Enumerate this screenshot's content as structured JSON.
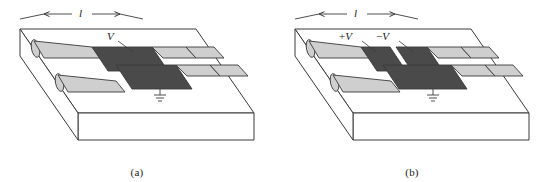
{
  "figure": {
    "type": "technical-line-diagram",
    "colors": {
      "outline": "#3a3a3a",
      "slab_face": "#ffffff",
      "strip_light": "#cfcfcf",
      "electrode_dark": "#4a4a4a",
      "background": "#ffffff"
    }
  },
  "panels": [
    {
      "id": "a",
      "caption": "(a)",
      "dimension_label": "l",
      "labels": [
        {
          "name": "voltage",
          "sign": "",
          "symbol": "V",
          "subscript": ""
        }
      ],
      "electrodes": 1,
      "ground_symbols": 1
    },
    {
      "id": "b",
      "caption": "(b)",
      "dimension_label": "l",
      "labels": [
        {
          "name": "voltage-positive",
          "sign": "+",
          "symbol": "V",
          "subscript": ""
        },
        {
          "name": "voltage-negative",
          "sign": "−",
          "symbol": "V",
          "subscript": ""
        }
      ],
      "electrodes": 2,
      "ground_symbols": 1
    }
  ]
}
